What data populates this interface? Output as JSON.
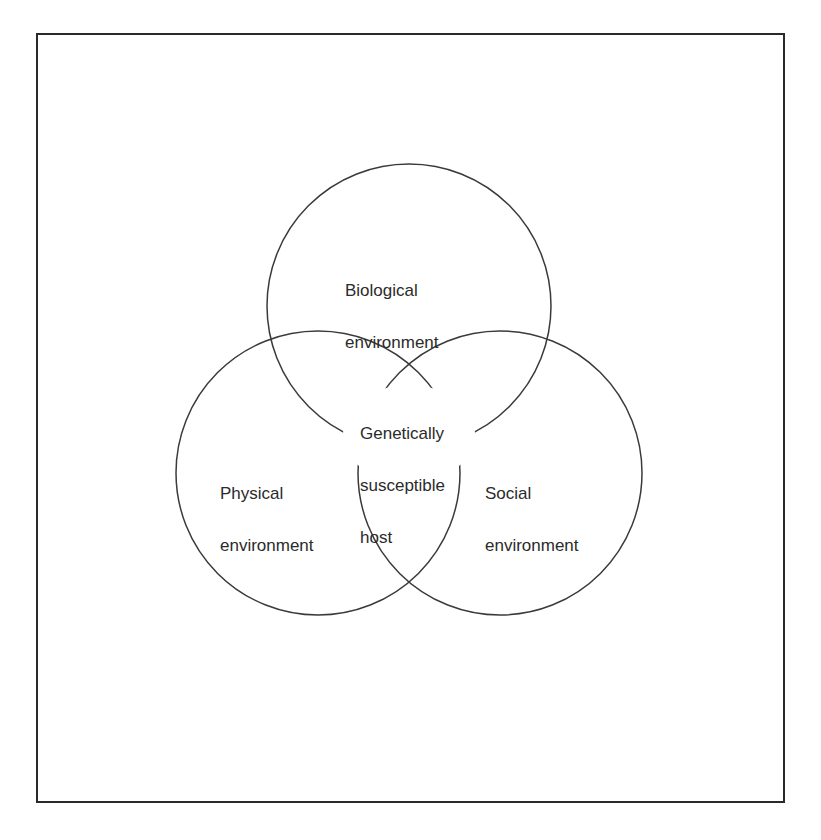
{
  "diagram": {
    "type": "venn",
    "style": {
      "line_color": "#3a3a3a",
      "frame_color": "#2a2a2a",
      "text_color": "#2b2b2b",
      "background": "#ffffff"
    },
    "sets": [
      {
        "id": "biological",
        "label": "Biological\nenvironment",
        "line1": "Biological",
        "line2": "environment",
        "position": "top"
      },
      {
        "id": "physical",
        "label": "Physical\nenvironment",
        "line1": "Physical",
        "line2": "environment",
        "position": "bottom-left"
      },
      {
        "id": "social",
        "label": "Social\nenvironment",
        "line1": "Social",
        "line2": "environment",
        "position": "bottom-right"
      }
    ],
    "intersection": {
      "label": "Genetically\nsusceptible\nhost",
      "line1": "Genetically",
      "line2": "susceptible",
      "line3": "host"
    }
  }
}
